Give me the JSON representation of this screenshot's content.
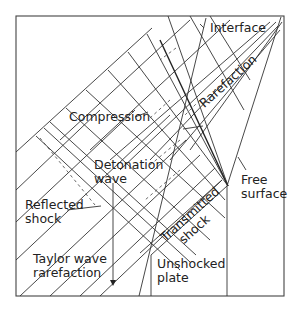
{
  "diagram": {
    "labels": {
      "interface": "Interface",
      "compression": "Compression",
      "rarefaction": "Rarefaction",
      "detonation_wave_1": "Detonation",
      "detonation_wave_2": "wave",
      "reflected_shock_1": "Reflected",
      "reflected_shock_2": "shock",
      "free_surface_1": "Free",
      "free_surface_2": "surface",
      "transmitted_shock_1": "Transmitted",
      "transmitted_shock_2": "shock",
      "taylor_1": "Taylor wave",
      "taylor_2": "rarefaction",
      "unshocked_1": "Unshocked",
      "unshocked_2": "plate"
    },
    "colors": {
      "line": "#333333",
      "background": "#ffffff"
    }
  }
}
